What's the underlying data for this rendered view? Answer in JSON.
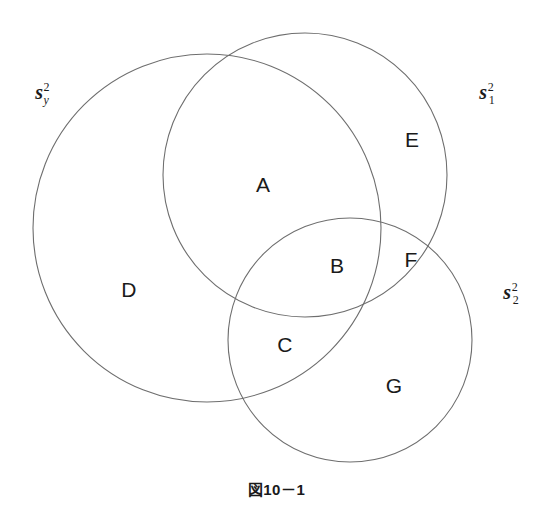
{
  "figure": {
    "caption": "図10－1",
    "width": 553,
    "height": 509,
    "background_color": "#ffffff",
    "stroke_color": "#6e6e6e",
    "text_color": "#1a1a1a"
  },
  "sets": [
    {
      "id": "sy",
      "base": "s",
      "superscript": "2",
      "subscript": "y",
      "subscript_style": "italic",
      "label_x": 42,
      "label_y": 92,
      "circle": {
        "cx": 207,
        "cy": 228,
        "r": 174
      }
    },
    {
      "id": "s1",
      "base": "s",
      "superscript": "2",
      "subscript": "1",
      "subscript_style": "normal",
      "label_x": 487,
      "label_y": 92,
      "circle": {
        "cx": 305,
        "cy": 175,
        "r": 142
      }
    },
    {
      "id": "s2",
      "base": "s",
      "superscript": "2",
      "subscript": "2",
      "subscript_style": "normal",
      "label_x": 511,
      "label_y": 292,
      "circle": {
        "cx": 350,
        "cy": 340,
        "r": 122
      }
    }
  ],
  "regions": [
    {
      "id": "A",
      "label": "A",
      "x": 263,
      "y": 184,
      "members": [
        "sy",
        "s1"
      ]
    },
    {
      "id": "B",
      "label": "B",
      "x": 337,
      "y": 265,
      "members": [
        "sy",
        "s1",
        "s2"
      ]
    },
    {
      "id": "C",
      "label": "C",
      "x": 285,
      "y": 344,
      "members": [
        "sy",
        "s2"
      ]
    },
    {
      "id": "D",
      "label": "D",
      "x": 129,
      "y": 289,
      "members": [
        "sy"
      ]
    },
    {
      "id": "E",
      "label": "E",
      "x": 412,
      "y": 139,
      "members": [
        "s1"
      ]
    },
    {
      "id": "F",
      "label": "F",
      "x": 411,
      "y": 259,
      "members": [
        "s1",
        "s2"
      ]
    },
    {
      "id": "G",
      "label": "G",
      "x": 394,
      "y": 385,
      "members": [
        "s2"
      ]
    }
  ]
}
